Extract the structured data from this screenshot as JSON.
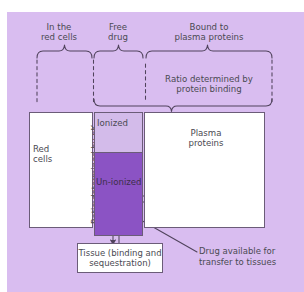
{
  "figure": {
    "background_color": "#d9bdf0",
    "ink_color": "#4a4a52",
    "stroke_color": "#6b5c78",
    "ionized_fill": "#d3bbea",
    "unionized_fill": "#8b53c4",
    "compartment_fill": "#ffffff"
  },
  "top_labels": {
    "red_cells": "In the\nred cells",
    "free_drug": "Free\ndrug",
    "bound": "Bound to\nplasma proteins"
  },
  "middle_label": {
    "protein_ratio": "Ratio determined by\nprotein binding"
  },
  "compartments": {
    "red_cells": "Red\ncells",
    "ionized": "Ionized",
    "unionized": "Un-ionized",
    "plasma_proteins": "Plasma\nproteins"
  },
  "vertical_label": {
    "pka_ratio_prefix": "Ratio determined by pK",
    "pka_ratio_sub": "a"
  },
  "callouts": {
    "tissue": "Tissue (binding\nand sequestration)",
    "drug_available": "Drug available for\ntransfer to tissues"
  }
}
